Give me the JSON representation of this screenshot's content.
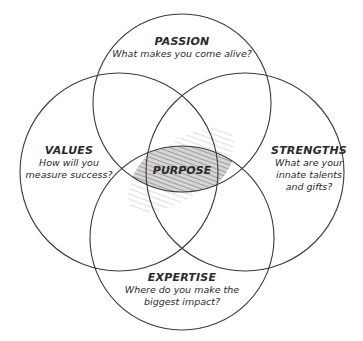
{
  "diagram": {
    "type": "venn-4",
    "line_color": "#3a3a3a",
    "shade_color": "#9a9a9a",
    "center": {
      "label": "PURPOSE"
    },
    "circles": [
      {
        "id": "passion",
        "title": "PASSION",
        "question": "What makes you come alive?",
        "cx": 182,
        "cy": 103,
        "r": 89
      },
      {
        "id": "values",
        "title": "VALUES",
        "question_lines": [
          "How will you",
          "measure success?"
        ],
        "cx": 119,
        "cy": 172,
        "r": 99
      },
      {
        "id": "strengths",
        "title": "STRENGTHS",
        "question_lines": [
          "What are your",
          "innate talents",
          "and gifts?"
        ],
        "cx": 245,
        "cy": 172,
        "r": 99
      },
      {
        "id": "expertise",
        "title": "EXPERTISE",
        "question_lines": [
          "Where do you make the",
          "biggest impact?"
        ],
        "cx": 182,
        "cy": 238,
        "r": 92
      }
    ]
  }
}
